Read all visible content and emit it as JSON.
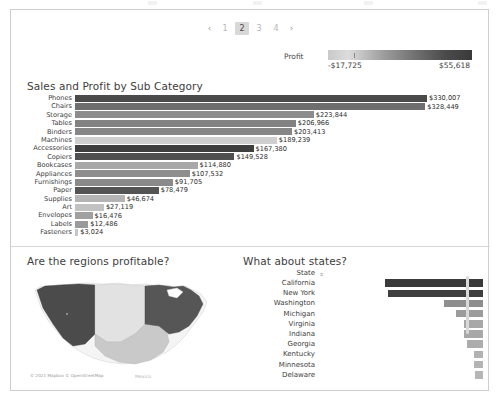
{
  "pagination": {
    "prev": "‹",
    "next": "›",
    "pages": [
      "1",
      "2",
      "3",
      "4"
    ],
    "active": "2"
  },
  "legend": {
    "title": "Profit",
    "min": "-$17,725",
    "max": "$55,618"
  },
  "subcategory_panel": {
    "title": "Sales and Profit by Sub Category"
  },
  "map_panel": {
    "title": "Are the regions profitable?",
    "credit": "© 2021 Mapbox © OpenStreetMap",
    "mexico_label": "Mexico"
  },
  "states_panel": {
    "title": "What about states?",
    "column_header": "State",
    "sort_icon": "sort-descending-icon"
  },
  "chart_data": [
    {
      "type": "bar",
      "title": "Sales and Profit by Sub Category",
      "orientation": "horizontal",
      "xlabel": "",
      "ylabel": "",
      "color_encoding": "Profit",
      "categories": [
        "Phones",
        "Chairs",
        "Storage",
        "Tables",
        "Binders",
        "Machines",
        "Accessories",
        "Copiers",
        "Bookcases",
        "Appliances",
        "Furnishings",
        "Paper",
        "Supplies",
        "Art",
        "Envelopes",
        "Labels",
        "Fasteners"
      ],
      "values": [
        330007,
        328449,
        223844,
        206966,
        203413,
        189239,
        167380,
        149528,
        114880,
        107532,
        91705,
        78479,
        46674,
        27119,
        16476,
        12486,
        3024
      ],
      "value_labels": [
        "$330,007",
        "$328,449",
        "$223,844",
        "$206,966",
        "$203,413",
        "$189,239",
        "$167,380",
        "$149,528",
        "$114,880",
        "$107,532",
        "$91,705",
        "$78,479",
        "$46,674",
        "$27,119",
        "$16,476",
        "$12,486",
        "$3,024"
      ],
      "bar_colors": [
        "#4a4a4a",
        "#6e6e6e",
        "#8c8c8c",
        "#828282",
        "#868686",
        "#cfcfcf",
        "#3f3f3f",
        "#4f4f4f",
        "#a8a8a8",
        "#8e8e8e",
        "#8a8a8a",
        "#545454",
        "#b4b4b4",
        "#c2c2c2",
        "#a0a0a0",
        "#9a9a9a",
        "#c6c6c6"
      ],
      "xlim": [
        0,
        330007
      ]
    },
    {
      "type": "bar",
      "title": "What about states?",
      "orientation": "horizontal",
      "xlabel": "",
      "ylabel": "",
      "categories": [
        "California",
        "New York",
        "Washington",
        "Michigan",
        "Virginia",
        "Indiana",
        "Georgia",
        "Kentucky",
        "Minnesota",
        "Delaware",
        "New Jersey"
      ],
      "values": [
        76381,
        74039,
        33403,
        24463,
        18598,
        18383,
        16250,
        11200,
        10823,
        9977,
        9773
      ],
      "value_labels": [
        "$76,381",
        "$74,039",
        "$33,403",
        "$24,463",
        "$18,598",
        "$18,383",
        "$16,250",
        "$11,200",
        "$10,823",
        "$9,977",
        ""
      ],
      "bar_colors": [
        "#3a3a3a",
        "#3f3f3f",
        "#8e8e8e",
        "#9c9c9c",
        "#a8a8a8",
        "#a8a8a8",
        "#acacac",
        "#b2b2b2",
        "#b4b4b4",
        "#b6b6b6",
        "#b8b8b8"
      ],
      "xlim": [
        0,
        76381
      ]
    },
    {
      "type": "map",
      "title": "Are the regions profitable?",
      "regions": [
        "West",
        "Central",
        "South",
        "East"
      ],
      "region_colors": [
        "#4b4b4b",
        "#e2e2e2",
        "#c9c9c9",
        "#565656"
      ]
    }
  ]
}
